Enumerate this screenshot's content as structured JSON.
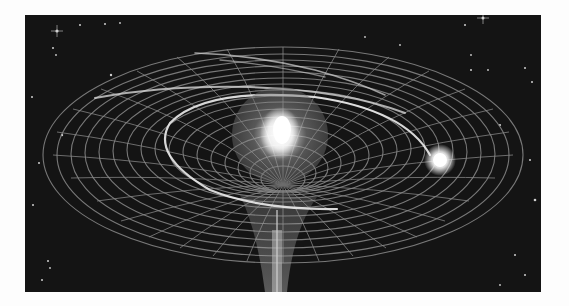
{
  "image": {
    "subject": "spacetime-curvature-illustration",
    "description": "Grayscale illustration of a warped spacetime grid (gravity well) with a glowing central star inside a translucent sphere and a bright orbiting body with an elliptical orbit trail, on a starry black background",
    "palette": {
      "background": "#141414",
      "grid": "#8a8a8a",
      "orbit": "#e6e6e6",
      "star_core": "#ffffff",
      "sphere": "#6e6e6e",
      "page": "#fdfdfd"
    },
    "elements": {
      "central_star": {
        "cx": 255,
        "cy": 120,
        "r": 48
      },
      "orbiting_body": {
        "cx": 415,
        "cy": 145,
        "r": 10
      },
      "grid_center": {
        "cx": 258,
        "cy": 140
      },
      "funnel_bottom": {
        "x": 255,
        "y": 277
      }
    }
  }
}
